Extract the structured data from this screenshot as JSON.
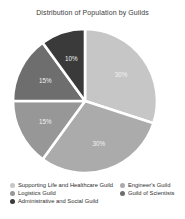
{
  "chart_data": {
    "type": "pie",
    "title": "Distribution of Population by Guilds",
    "start_angle_deg": 90,
    "direction": "clockwise",
    "legend_position": "bottom",
    "slices": [
      {
        "label": "Supporting Life and Healthcare Guild",
        "value": 30,
        "pct_label": "30%",
        "color": "#c6c6c6"
      },
      {
        "label": "Engineer's Guild",
        "value": 30,
        "pct_label": "30%",
        "color": "#ababab"
      },
      {
        "label": "Logistics Guild",
        "value": 15,
        "pct_label": "15%",
        "color": "#979797"
      },
      {
        "label": "Guild of Scientists",
        "value": 15,
        "pct_label": "15%",
        "color": "#6e6e6e"
      },
      {
        "label": "Administrative and Social Guild",
        "value": 10,
        "pct_label": "10%",
        "color": "#3a3a3a"
      }
    ],
    "legend_columns": [
      [
        "Supporting Life and Healthcare Guild",
        "Logistics Guild",
        "Administrative and Social Guild"
      ],
      [
        "Engineer's Guild",
        "Guild of Scientists"
      ]
    ]
  }
}
